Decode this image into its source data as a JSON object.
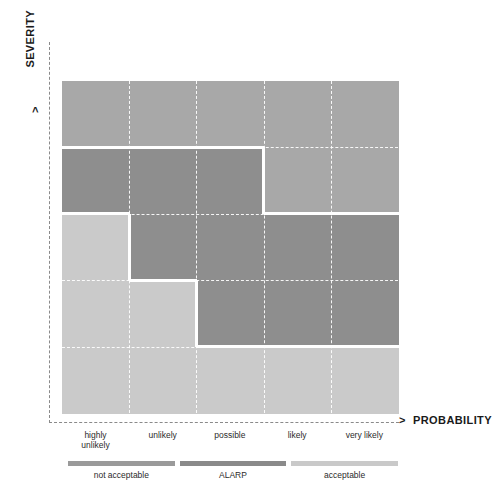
{
  "axes": {
    "y_title": "SEVERITY",
    "x_title": "PROBABILITY",
    "arrow_glyph": ">"
  },
  "chart_data": {
    "type": "heatmap",
    "title": "",
    "xlabel": "PROBABILITY",
    "ylabel": "SEVERITY",
    "grid": true,
    "legend_position": "bottom",
    "categories": [
      "highly unlikely",
      "unlikely",
      "possible",
      "likely",
      "very likely"
    ],
    "x_tick_lines": [
      [
        "highly",
        "unlikely"
      ],
      [
        "unlikely",
        ""
      ],
      [
        "possible",
        ""
      ],
      [
        "likely",
        ""
      ],
      [
        "very likely",
        ""
      ]
    ],
    "rows": [
      "extensive",
      "major",
      "medium",
      "minor",
      "no impact"
    ],
    "zones": [
      "not acceptable",
      "ALARP",
      "acceptable"
    ],
    "colors": {
      "not_acceptable": "#8e8e8e",
      "alarp": "#a8a8a8",
      "acceptable": "#cacaca",
      "separator": "#ffffff",
      "gridline": "#ffffff",
      "axis": "#8a8a8a",
      "text": "#2b2b2b"
    },
    "matrix": [
      {
        "row": "extensive",
        "cells": [
          "alarp",
          "alarp",
          "alarp",
          "alarp",
          "alarp"
        ]
      },
      {
        "row": "major",
        "cells": [
          "not_acceptable",
          "not_acceptable",
          "not_acceptable",
          "alarp",
          "alarp"
        ]
      },
      {
        "row": "medium",
        "cells": [
          "acceptable",
          "not_acceptable",
          "not_acceptable",
          "not_acceptable",
          "not_acceptable"
        ]
      },
      {
        "row": "minor",
        "cells": [
          "acceptable",
          "acceptable",
          "not_acceptable",
          "not_acceptable",
          "not_acceptable"
        ]
      },
      {
        "row": "no impact",
        "cells": [
          "acceptable",
          "acceptable",
          "acceptable",
          "acceptable",
          "acceptable"
        ]
      }
    ]
  },
  "legend": {
    "items": [
      {
        "label": "not acceptable",
        "color": "#9a9a9a"
      },
      {
        "label": "ALARP",
        "color": "#8a8a8a"
      },
      {
        "label": "acceptable",
        "color": "#c9c9c9"
      }
    ]
  }
}
